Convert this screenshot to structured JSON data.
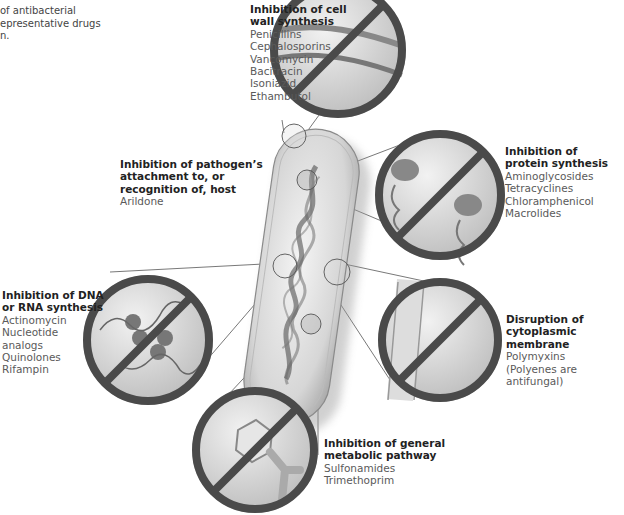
{
  "intro": {
    "lines": [
      "of antibacterial",
      "epresentative drugs",
      "n."
    ]
  },
  "targets": [
    {
      "id": "cell-wall",
      "title_lines": [
        "Inhibition of cell",
        "wall synthesis"
      ],
      "drugs": [
        "Penicillins",
        "Cephalosporins",
        "Vancomycin",
        "Bacitracin",
        "Isoniazid",
        "Ethambutol"
      ]
    },
    {
      "id": "attachment",
      "title_lines": [
        "Inhibition of pathogen’s",
        "attachment to, or",
        "recognition of, host"
      ],
      "drugs": [
        "Arildone"
      ]
    },
    {
      "id": "protein",
      "title_lines": [
        "Inhibition of",
        "protein synthesis"
      ],
      "drugs": [
        "Aminoglycosides",
        "Tetracyclines",
        "Chloramphenicol",
        "Macrolides"
      ]
    },
    {
      "id": "dna-rna",
      "title_lines": [
        "Inhibition of DNA",
        "or RNA synthesis"
      ],
      "drugs": [
        "Actinomycin",
        "Nucleotide",
        "analogs",
        "Quinolones",
        "Rifampin"
      ]
    },
    {
      "id": "membrane",
      "title_lines": [
        "Disruption of",
        "cytoplasmic membrane"
      ],
      "drugs": [
        "Polymyxins",
        "(Polyenes are antifungal)"
      ]
    },
    {
      "id": "metabolic",
      "title_lines": [
        "Inhibition of general",
        "metabolic pathway"
      ],
      "drugs": [
        "Sulfonamides",
        "Trimethoprim"
      ]
    }
  ],
  "colors": {
    "prohibit_ring": "#4a4a4a",
    "label_title": "#222222",
    "label_text": "#5a5a5a",
    "leader_line": "#555555"
  }
}
